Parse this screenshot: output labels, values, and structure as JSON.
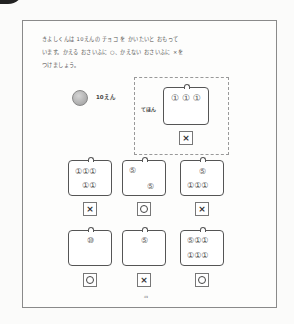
{
  "instruction": {
    "lines": [
      "きよしくんは 10えんの チョコ を かいたいと おもって",
      "います。かえる おさいふに ○、かえない おさいふに ×を",
      "つけましょう。"
    ]
  },
  "price": {
    "coin_icon": "10-yen-coin-icon",
    "label": "10えん"
  },
  "example": {
    "label": "てほん",
    "wallet": {
      "coins_top": "① ① ①",
      "coins_bottom": ""
    },
    "answer": "×"
  },
  "wallets": [
    {
      "coins_top": "①①①",
      "coins_bottom": "①①",
      "answer": "×"
    },
    {
      "coins_top": "⑤",
      "coins_bottom": "⑤",
      "answer": "○"
    },
    {
      "coins_top": "⑤",
      "coins_bottom": "①①①",
      "answer": "×"
    },
    {
      "coins_top": "⑩",
      "coins_bottom": "",
      "answer": "○"
    },
    {
      "coins_top": "⑤",
      "coins_bottom": "",
      "answer": "×"
    },
    {
      "coins_top": "⑤①①",
      "coins_bottom": "①①①",
      "answer": "○"
    }
  ],
  "answer_symbols": {
    "circle": "○",
    "cross": "×"
  },
  "page_number": "49"
}
